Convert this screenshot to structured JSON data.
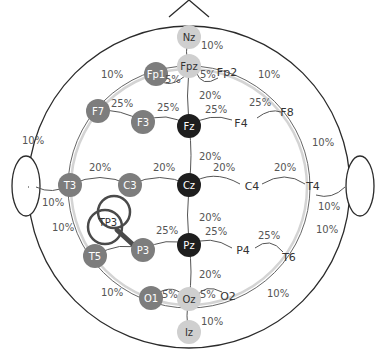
{
  "diagram": {
    "colors": {
      "outline": "#2b2b2b",
      "arc": "#555555",
      "guide": "#cfcfcf",
      "node_dark": "#1e1e1e",
      "node_mid": "#7d7d7d",
      "node_light": "#cfcfcf",
      "text_light": "#ffffff",
      "text_dark": "#333333",
      "magnifier": "#4a4a4a"
    },
    "nodes": [
      {
        "id": "Nz",
        "label": "Nz",
        "x": 189,
        "y": 37,
        "style": "light"
      },
      {
        "id": "Fpz",
        "label": "Fpz",
        "x": 189,
        "y": 66,
        "style": "light"
      },
      {
        "id": "Fp1",
        "label": "Fp1",
        "x": 156,
        "y": 74,
        "style": "mid"
      },
      {
        "id": "F7",
        "label": "F7",
        "x": 98,
        "y": 111,
        "style": "mid"
      },
      {
        "id": "F3",
        "label": "F3",
        "x": 143,
        "y": 122,
        "style": "mid"
      },
      {
        "id": "Fz",
        "label": "Fz",
        "x": 189,
        "y": 126,
        "style": "dark"
      },
      {
        "id": "T3",
        "label": "T3",
        "x": 70,
        "y": 185,
        "style": "mid"
      },
      {
        "id": "C3",
        "label": "C3",
        "x": 130,
        "y": 185,
        "style": "mid"
      },
      {
        "id": "Cz",
        "label": "Cz",
        "x": 189,
        "y": 185,
        "style": "dark"
      },
      {
        "id": "P3",
        "label": "P3",
        "x": 143,
        "y": 250,
        "style": "mid"
      },
      {
        "id": "Pz",
        "label": "Pz",
        "x": 189,
        "y": 245,
        "style": "dark"
      },
      {
        "id": "T5",
        "label": "T5",
        "x": 95,
        "y": 256,
        "style": "mid"
      },
      {
        "id": "O1",
        "label": "O1",
        "x": 151,
        "y": 298,
        "style": "mid"
      },
      {
        "id": "Oz",
        "label": "Oz",
        "x": 189,
        "y": 299,
        "style": "light"
      },
      {
        "id": "Iz",
        "label": "Iz",
        "x": 189,
        "y": 332,
        "style": "light"
      }
    ],
    "text_nodes": [
      {
        "id": "Fp2",
        "label": "Fp2",
        "x": 227,
        "y": 76
      },
      {
        "id": "F4",
        "label": "F4",
        "x": 241,
        "y": 127
      },
      {
        "id": "F8",
        "label": "F8",
        "x": 287,
        "y": 116
      },
      {
        "id": "C4",
        "label": "C4",
        "x": 252,
        "y": 190
      },
      {
        "id": "T4",
        "label": "T4",
        "x": 313,
        "y": 190
      },
      {
        "id": "P4",
        "label": "P4",
        "x": 243,
        "y": 254
      },
      {
        "id": "T6",
        "label": "T6",
        "x": 289,
        "y": 261
      },
      {
        "id": "O2",
        "label": "O2",
        "x": 228,
        "y": 300
      }
    ],
    "magnifier": {
      "label": "TP3",
      "x": 108,
      "y": 220
    },
    "percent_labels": [
      {
        "text": "10%",
        "x": 201,
        "y": 49
      },
      {
        "text": "5%",
        "x": 165,
        "y": 83
      },
      {
        "text": "5%",
        "x": 200,
        "y": 78
      },
      {
        "text": "10%",
        "x": 101,
        "y": 78
      },
      {
        "text": "10%",
        "x": 258,
        "y": 78
      },
      {
        "text": "20%",
        "x": 199,
        "y": 99
      },
      {
        "text": "25%",
        "x": 111,
        "y": 107
      },
      {
        "text": "25%",
        "x": 157,
        "y": 111
      },
      {
        "text": "25%",
        "x": 205,
        "y": 113
      },
      {
        "text": "25%",
        "x": 249,
        "y": 106
      },
      {
        "text": "10%",
        "x": 22,
        "y": 144
      },
      {
        "text": "10%",
        "x": 312,
        "y": 146
      },
      {
        "text": "20%",
        "x": 199,
        "y": 160
      },
      {
        "text": "20%",
        "x": 89,
        "y": 171
      },
      {
        "text": "20%",
        "x": 153,
        "y": 171
      },
      {
        "text": "20%",
        "x": 213,
        "y": 171
      },
      {
        "text": "20%",
        "x": 274,
        "y": 171
      },
      {
        "text": "10%",
        "x": 42,
        "y": 206
      },
      {
        "text": "10%",
        "x": 318,
        "y": 210
      },
      {
        "text": "20%",
        "x": 199,
        "y": 221
      },
      {
        "text": "10%",
        "x": 52,
        "y": 231
      },
      {
        "text": "10%",
        "x": 316,
        "y": 233
      },
      {
        "text": "25%",
        "x": 156,
        "y": 234
      },
      {
        "text": "25%",
        "x": 205,
        "y": 235
      },
      {
        "text": "25%",
        "x": 258,
        "y": 239
      },
      {
        "text": "20%",
        "x": 199,
        "y": 278
      },
      {
        "text": "10%",
        "x": 101,
        "y": 296
      },
      {
        "text": "5%",
        "x": 162,
        "y": 298
      },
      {
        "text": "5%",
        "x": 200,
        "y": 298
      },
      {
        "text": "10%",
        "x": 267,
        "y": 297
      },
      {
        "text": "10%",
        "x": 201,
        "y": 325
      }
    ]
  }
}
